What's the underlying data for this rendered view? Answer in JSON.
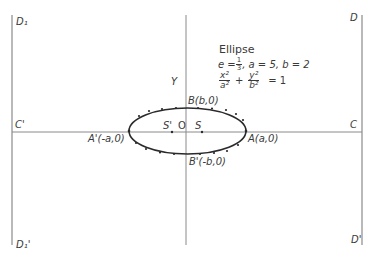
{
  "diagram": {
    "title": "Ellipse",
    "params": {
      "eccentricity_label": "e = ",
      "e_num": "1",
      "e_den": "3",
      "rest": ",  a = 5,  b = 2"
    },
    "equation": {
      "term1_num": "x²",
      "term1_den": "a²",
      "op": "+",
      "term2_num": "y²",
      "term2_den": "b²",
      "rhs": "= 1"
    },
    "labels": {
      "y_axis": "Y",
      "B": "B(b,0)",
      "B_prime": "B'(-b,0)",
      "A": "A(a,0)",
      "A_prime": "A'(-a,0)",
      "S_prime": "S'",
      "O": "O",
      "S": "S",
      "C": "C",
      "C_prime": "C'",
      "D": "D",
      "D_prime": "D'",
      "D1": "D₁",
      "D1_prime": "D₁'"
    },
    "colors": {
      "line": "#8a8a8a",
      "curve": "#2a2a2a",
      "text": "#3a3a3a"
    }
  }
}
